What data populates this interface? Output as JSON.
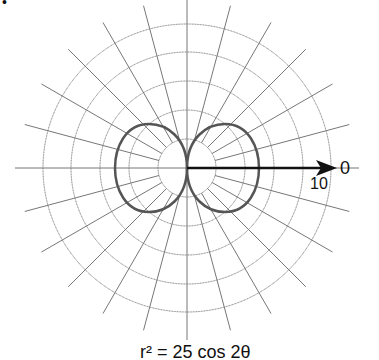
{
  "chart_data": {
    "type": "polar",
    "title": "r² = 25 cos 2θ",
    "rings": 5,
    "spoke_step_deg": 15,
    "axis_label_angle": "0",
    "axis_tick_label": "10",
    "curve": "two-lobed lemniscate-like curve through the pole",
    "corner_mark": "•"
  },
  "labels": {
    "zero": "0",
    "ten": "10",
    "equation": "r² = 25 cos 2θ",
    "corner": "•"
  }
}
